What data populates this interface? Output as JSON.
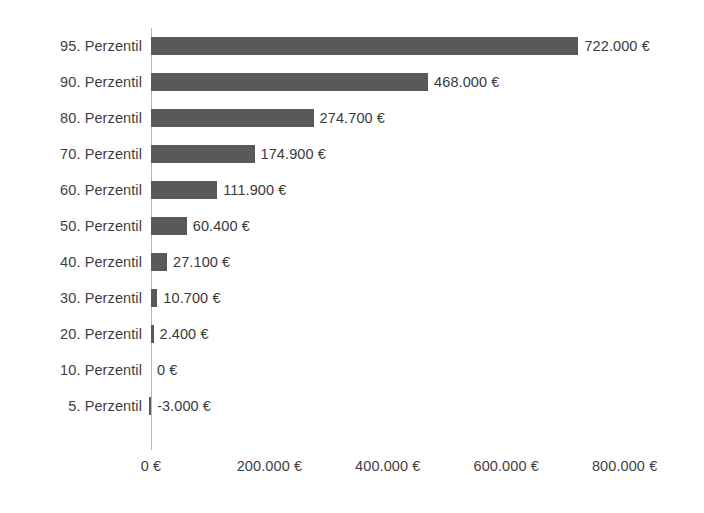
{
  "chart_data": {
    "type": "bar",
    "orientation": "horizontal",
    "title": "",
    "subtitle": "",
    "xlabel": "",
    "ylabel": "",
    "categories": [
      "95. Perzentil",
      "90. Perzentil",
      "80. Perzentil",
      "70. Perzentil",
      "60. Perzentil",
      "50. Perzentil",
      "40. Perzentil",
      "30. Perzentil",
      "20. Perzentil",
      "10. Perzentil",
      "5. Perzentil"
    ],
    "values": [
      722000,
      468000,
      274700,
      174900,
      111900,
      60400,
      27100,
      10700,
      2400,
      0,
      -3000
    ],
    "value_labels": [
      "722.000 €",
      "468.000 €",
      "274.700 €",
      "174.900 €",
      "111.900 €",
      "60.400 €",
      "27.100 €",
      "10.700 €",
      "2.400 €",
      "0 €",
      "-3.000 €"
    ],
    "xlim": [
      -20000,
      860000
    ],
    "xticks": [
      0,
      200000,
      400000,
      600000,
      800000
    ],
    "xtick_labels": [
      "0 €",
      "200.000 €",
      "400.000 €",
      "600.000 €",
      "800.000 €"
    ],
    "grid": false,
    "legend": null,
    "currency": "€",
    "bar_color": "#595959",
    "axis_line_color": "#b9b9b9",
    "text_color": "#3f3f3f",
    "background_color": "#ffffff",
    "data_labels_shown": true
  }
}
